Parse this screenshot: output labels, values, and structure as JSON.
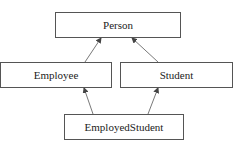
{
  "diagram": {
    "type": "class-inheritance",
    "nodes": [
      {
        "id": "person",
        "label": "Person",
        "x": 55,
        "y": 12,
        "w": 126,
        "h": 26
      },
      {
        "id": "employee",
        "label": "Employee",
        "x": 0,
        "y": 62,
        "w": 112,
        "h": 26
      },
      {
        "id": "student",
        "label": "Student",
        "x": 120,
        "y": 62,
        "w": 113,
        "h": 26
      },
      {
        "id": "employedstudent",
        "label": "EmployedStudent",
        "x": 64,
        "y": 114,
        "w": 120,
        "h": 26
      }
    ],
    "edges": [
      {
        "from": "employee",
        "to": "person",
        "x1": 85,
        "y1": 62,
        "x2": 101,
        "y2": 38
      },
      {
        "from": "student",
        "to": "person",
        "x1": 158,
        "y1": 62,
        "x2": 132,
        "y2": 38
      },
      {
        "from": "employedstudent",
        "to": "employee",
        "x1": 93,
        "y1": 114,
        "x2": 84,
        "y2": 88
      },
      {
        "from": "employedstudent",
        "to": "student",
        "x1": 148,
        "y1": 114,
        "x2": 158,
        "y2": 88
      }
    ],
    "colors": {
      "stroke": "#555555",
      "text": "#222222",
      "background": "#ffffff"
    }
  }
}
